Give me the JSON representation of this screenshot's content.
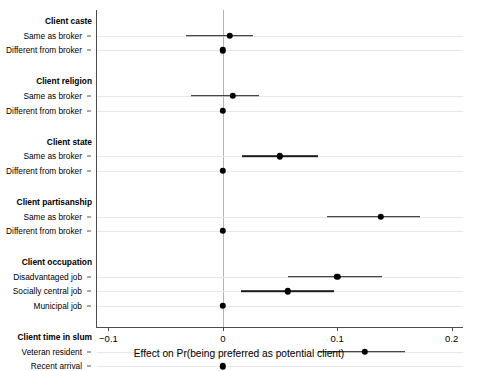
{
  "chart_data": {
    "type": "scatter",
    "title": "",
    "xlabel": "Effect on Pr(being preferred as potential client)",
    "ylabel": "",
    "xlim": [
      -0.11,
      0.21
    ],
    "xticks": [
      -0.1,
      0,
      0.1,
      0.2
    ],
    "xticklabels": [
      "−0.1",
      "0",
      "0.1",
      "0.2"
    ],
    "grid": "horizontal",
    "legend": "none",
    "reference_line": 0,
    "groups": [
      {
        "name": "Client caste",
        "rows": [
          {
            "label": "Same as broker",
            "estimate": 0.006,
            "ci_low": -0.032,
            "ci_high": 0.026,
            "reference": false
          },
          {
            "label": "Different from broker",
            "estimate": 0.0,
            "ci_low": 0.0,
            "ci_high": 0.0,
            "reference": true
          }
        ]
      },
      {
        "name": "Client religion",
        "rows": [
          {
            "label": "Same as broker",
            "estimate": 0.009,
            "ci_low": -0.028,
            "ci_high": 0.032,
            "reference": false
          },
          {
            "label": "Different from broker",
            "estimate": 0.0,
            "ci_low": 0.0,
            "ci_high": 0.0,
            "reference": true
          }
        ]
      },
      {
        "name": "Client state",
        "rows": [
          {
            "label": "Same as broker",
            "estimate": 0.05,
            "ci_low": 0.017,
            "ci_high": 0.083,
            "reference": false
          },
          {
            "label": "Different from broker",
            "estimate": 0.0,
            "ci_low": 0.0,
            "ci_high": 0.0,
            "reference": true
          }
        ]
      },
      {
        "name": "Client partisanship",
        "rows": [
          {
            "label": "Same as broker",
            "estimate": 0.138,
            "ci_low": 0.091,
            "ci_high": 0.172,
            "reference": false
          },
          {
            "label": "Different from broker",
            "estimate": 0.0,
            "ci_low": 0.0,
            "ci_high": 0.0,
            "reference": true
          }
        ]
      },
      {
        "name": "Client occupation",
        "rows": [
          {
            "label": "Disadvantaged job",
            "estimate": 0.1,
            "ci_low": 0.057,
            "ci_high": 0.139,
            "reference": false
          },
          {
            "label": "Socially central job",
            "estimate": 0.057,
            "ci_low": 0.016,
            "ci_high": 0.097,
            "reference": false
          },
          {
            "label": "Municipal job",
            "estimate": 0.0,
            "ci_low": 0.0,
            "ci_high": 0.0,
            "reference": true
          }
        ]
      },
      {
        "name": "Client time in slum",
        "rows": [
          {
            "label": "Veteran resident",
            "estimate": 0.124,
            "ci_low": 0.083,
            "ci_high": 0.159,
            "reference": false
          },
          {
            "label": "Recent arrival",
            "estimate": 0.0,
            "ci_low": 0.0,
            "ci_high": 0.0,
            "reference": true
          }
        ]
      }
    ],
    "colors": {
      "point": "#000000",
      "ci": "#1a1a1a",
      "grid": "#e8e8e8",
      "zero_line": "#b4b4b4",
      "axis": "#4d4d4d",
      "background": "#ffffff"
    }
  }
}
